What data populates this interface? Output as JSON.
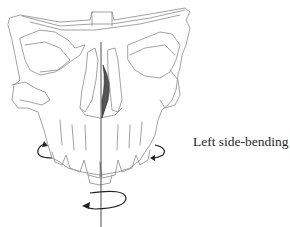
{
  "figure": {
    "label": "Left side-bending",
    "colors": {
      "line": "#8a8a8a",
      "arrow": "#222222",
      "text": "#2a2a2a",
      "shading": "#555555",
      "background": "#ffffff"
    },
    "arrows": [
      {
        "name": "right-molar-rotation",
        "position": "left side near teeth",
        "direction": "upward curl"
      },
      {
        "name": "left-molar-rotation",
        "position": "right side near teeth",
        "direction": "inward curl"
      },
      {
        "name": "vertical-axis-rotation",
        "position": "below teeth on midline",
        "direction": "counter-clockwise around vertical axis"
      }
    ]
  }
}
